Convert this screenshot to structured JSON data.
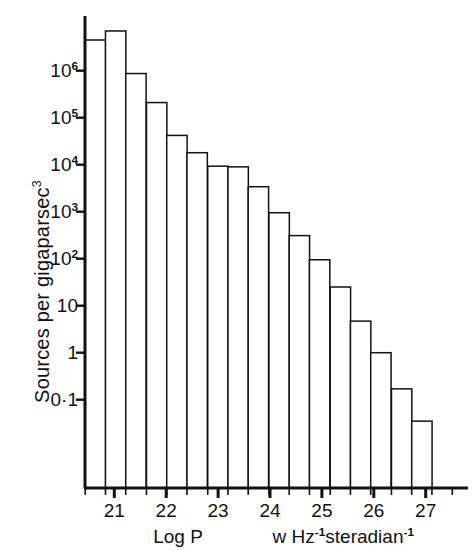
{
  "chart_data": {
    "type": "bar",
    "title": "",
    "subtitle": "",
    "xlabel_left": "Log P",
    "xlabel_right_parts": {
      "lead": "w Hz",
      "exp1": "-1",
      "mid": "steradian",
      "exp2": "-1"
    },
    "ylabel_text": "Sources per gigaparsec",
    "ylabel_exponent": "3",
    "grid": false,
    "legend": null,
    "yscale": "log",
    "ylim": [
      0.018,
      12000000
    ],
    "xlim": [
      20.44,
      27.56
    ],
    "ytick_values": [
      1000000,
      100000,
      10000,
      1000,
      100,
      10,
      1,
      0.1
    ],
    "ytick_labels": [
      "10^6",
      "10^5",
      "10^4",
      "10^3",
      "10^2",
      "10",
      "1",
      "0·1"
    ],
    "ytick_mantissa": [
      "10",
      "10",
      "10",
      "10",
      "10",
      "10",
      "1",
      "0·1"
    ],
    "ytick_exponent": [
      "6",
      "5",
      "4",
      "3",
      "2",
      "",
      "",
      ""
    ],
    "xtick_values": [
      21,
      22,
      23,
      24,
      25,
      26,
      27
    ],
    "xtick_labels": [
      "21",
      "22",
      "23",
      "24",
      "25",
      "26",
      "27"
    ],
    "bin_width_dex": 0.3926,
    "x_left_edges": [
      20.44,
      20.83,
      21.22,
      21.62,
      22.01,
      22.4,
      22.8,
      23.19,
      23.58,
      23.98,
      24.37,
      24.76,
      25.16,
      25.55,
      25.94,
      26.34,
      26.73,
      27.12
    ],
    "values": [
      4500000,
      7000000,
      870000,
      210000,
      42000,
      18000,
      9300,
      9000,
      3400,
      950,
      310,
      95,
      25,
      4.7,
      1.0,
      0.17,
      0.035,
      0.0
    ],
    "bar_count": 18,
    "bar_face_color": "#ffffff",
    "bar_edge_color": "#111111",
    "axis_color": "#111111",
    "background_color": "#ffffff"
  },
  "axes_geometry": {
    "plot_left_px": 85,
    "plot_right_px": 455,
    "baseline_y_px": 488,
    "top_y_px": 18,
    "decade_px": 47.0,
    "y_ref_value": 1000000,
    "y_ref_px": 70.7,
    "x_ref_value": 21,
    "x_ref_px": 114.3,
    "x_decade_px": 51.9
  }
}
